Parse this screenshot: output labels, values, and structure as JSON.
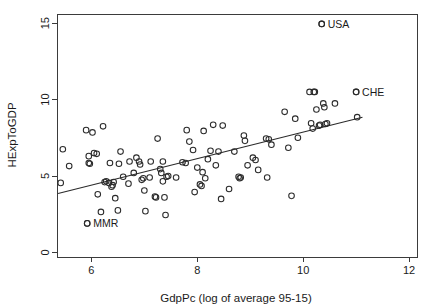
{
  "chart_data": {
    "type": "scatter",
    "title": "",
    "xlabel": "GdpPc (log of average 95-15)",
    "ylabel": "HExpToGDP",
    "xlim": [
      5.35,
      12.15
    ],
    "ylim": [
      -0.3,
      15.6
    ],
    "xticks": [
      6,
      8,
      10,
      12
    ],
    "xticklabels": [
      "6",
      "8",
      "10",
      "12"
    ],
    "yticks": [
      0,
      5,
      10,
      15
    ],
    "yticklabels": [
      "0",
      "5",
      "10",
      "15"
    ],
    "grid": false,
    "legend": null,
    "marker": "open-circle",
    "annotations": [
      {
        "label": "USA",
        "x": 10.35,
        "y": 14.95
      },
      {
        "label": "CHE",
        "x": 11.0,
        "y": 10.5
      },
      {
        "label": "MMR",
        "x": 5.92,
        "y": 1.9
      }
    ],
    "fit_line": {
      "label": "linear fit",
      "x0": 5.37,
      "y0": 3.85,
      "x1": 11.12,
      "y1": 8.85
    },
    "points": [
      [
        5.42,
        4.55
      ],
      [
        5.46,
        6.75
      ],
      [
        5.58,
        5.65
      ],
      [
        5.9,
        8.0
      ],
      [
        5.92,
        1.9
      ],
      [
        5.95,
        6.3
      ],
      [
        5.95,
        5.85
      ],
      [
        5.97,
        5.8
      ],
      [
        6.02,
        7.85
      ],
      [
        6.05,
        6.5
      ],
      [
        6.1,
        6.45
      ],
      [
        6.12,
        3.8
      ],
      [
        6.18,
        2.65
      ],
      [
        6.22,
        8.25
      ],
      [
        6.25,
        4.6
      ],
      [
        6.28,
        4.65
      ],
      [
        6.33,
        4.55
      ],
      [
        6.35,
        5.85
      ],
      [
        6.38,
        4.3
      ],
      [
        6.4,
        4.4
      ],
      [
        6.42,
        4.6
      ],
      [
        6.45,
        3.55
      ],
      [
        6.5,
        2.75
      ],
      [
        6.52,
        5.8
      ],
      [
        6.55,
        6.6
      ],
      [
        6.6,
        4.95
      ],
      [
        6.7,
        4.5
      ],
      [
        6.72,
        5.95
      ],
      [
        6.8,
        5.2
      ],
      [
        6.85,
        6.2
      ],
      [
        6.9,
        5.95
      ],
      [
        6.92,
        5.75
      ],
      [
        6.95,
        4.75
      ],
      [
        6.98,
        4.85
      ],
      [
        7.0,
        4.05
      ],
      [
        7.02,
        2.7
      ],
      [
        7.1,
        4.9
      ],
      [
        7.12,
        5.95
      ],
      [
        7.2,
        3.65
      ],
      [
        7.22,
        3.6
      ],
      [
        7.25,
        7.45
      ],
      [
        7.3,
        5.45
      ],
      [
        7.32,
        5.2
      ],
      [
        7.35,
        4.65
      ],
      [
        7.35,
        5.95
      ],
      [
        7.38,
        3.6
      ],
      [
        7.4,
        2.45
      ],
      [
        7.42,
        4.95
      ],
      [
        7.45,
        5.0
      ],
      [
        7.6,
        4.9
      ],
      [
        7.72,
        5.9
      ],
      [
        7.78,
        5.85
      ],
      [
        7.8,
        8.0
      ],
      [
        7.85,
        7.25
      ],
      [
        7.92,
        6.7
      ],
      [
        7.95,
        3.95
      ],
      [
        8.0,
        5.55
      ],
      [
        8.05,
        4.45
      ],
      [
        8.08,
        4.35
      ],
      [
        8.1,
        5.25
      ],
      [
        8.12,
        7.95
      ],
      [
        8.15,
        4.85
      ],
      [
        8.2,
        6.1
      ],
      [
        8.25,
        6.65
      ],
      [
        8.3,
        8.35
      ],
      [
        8.35,
        5.7
      ],
      [
        8.4,
        6.6
      ],
      [
        8.45,
        3.5
      ],
      [
        8.48,
        8.3
      ],
      [
        8.6,
        4.15
      ],
      [
        8.7,
        6.6
      ],
      [
        8.78,
        4.95
      ],
      [
        8.8,
        4.85
      ],
      [
        8.82,
        4.9
      ],
      [
        8.88,
        7.65
      ],
      [
        8.9,
        7.3
      ],
      [
        8.95,
        5.7
      ],
      [
        9.05,
        6.2
      ],
      [
        9.1,
        6.05
      ],
      [
        9.15,
        5.4
      ],
      [
        9.3,
        7.45
      ],
      [
        9.32,
        4.9
      ],
      [
        9.35,
        7.4
      ],
      [
        9.4,
        7.05
      ],
      [
        9.65,
        9.2
      ],
      [
        9.72,
        6.85
      ],
      [
        9.78,
        3.7
      ],
      [
        9.85,
        8.75
      ],
      [
        9.9,
        7.5
      ],
      [
        10.12,
        10.5
      ],
      [
        10.15,
        8.45
      ],
      [
        10.18,
        8.1
      ],
      [
        10.2,
        10.5
      ],
      [
        10.22,
        10.5
      ],
      [
        10.25,
        9.35
      ],
      [
        10.3,
        8.3
      ],
      [
        10.32,
        8.35
      ],
      [
        10.35,
        14.95
      ],
      [
        10.38,
        9.75
      ],
      [
        10.4,
        9.5
      ],
      [
        10.42,
        8.4
      ],
      [
        10.45,
        8.45
      ],
      [
        10.6,
        9.75
      ],
      [
        11.0,
        10.5
      ],
      [
        11.02,
        8.85
      ]
    ]
  },
  "axes": {
    "x_title": "GdpPc (log of average 95-15)",
    "y_title": "HExpToGDP"
  }
}
